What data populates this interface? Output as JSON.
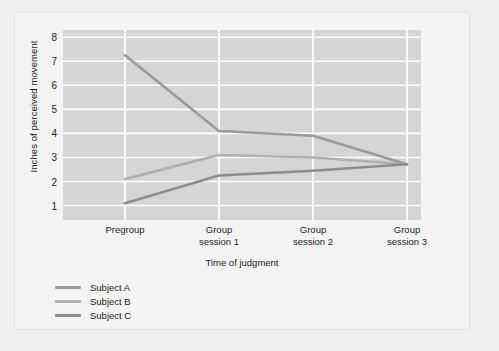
{
  "chart_data": {
    "type": "line",
    "title": "",
    "xlabel": "Time of judgment",
    "ylabel": "Inches of perceived movement",
    "categories": [
      "Pregroup",
      "Group\nsession 1",
      "Group\nsession 2",
      "Group\nsession 3"
    ],
    "x": [
      0,
      1,
      2,
      3
    ],
    "ylim": [
      0.4,
      8.3
    ],
    "yticks": [
      1,
      2,
      3,
      4,
      5,
      6,
      7,
      8
    ],
    "ytick_labels": [
      "1",
      "2",
      "3",
      "4",
      "5",
      "6",
      "7",
      "8"
    ],
    "grid": true,
    "grid_color": "#ffffff",
    "plot_background": "#d5d5d5",
    "legend_position": "below-left",
    "series": [
      {
        "name": "Subject A",
        "values": [
          7.25,
          4.1,
          3.9,
          2.72
        ],
        "color": "#9a9a9a"
      },
      {
        "name": "Subject B",
        "values": [
          2.1,
          3.1,
          3.0,
          2.72
        ],
        "color": "#b0b0b0"
      },
      {
        "name": "Subject C",
        "values": [
          1.1,
          2.25,
          2.45,
          2.72
        ],
        "color": "#8d8d8d"
      }
    ]
  },
  "legend": {
    "items": [
      {
        "label": "Subject A"
      },
      {
        "label": "Subject B"
      },
      {
        "label": "Subject C"
      }
    ]
  },
  "axes": {
    "y_label": "Inches of perceived movement",
    "x_label": "Time of judgment",
    "y_ticks": [
      "8",
      "7",
      "6",
      "5",
      "4",
      "3",
      "2",
      "1"
    ],
    "x_ticks": [
      "Pregroup",
      "Group\nsession 1",
      "Group\nsession 2",
      "Group\nsession 3"
    ]
  }
}
